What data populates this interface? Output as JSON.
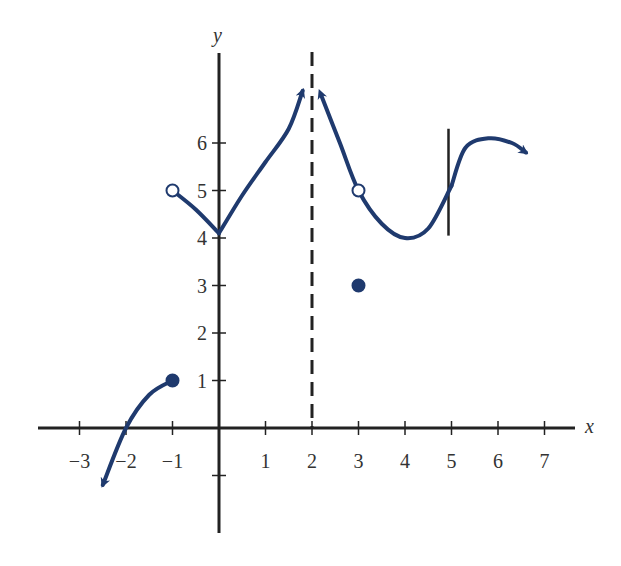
{
  "chart_data": {
    "type": "line",
    "title": "",
    "xlabel": "x",
    "ylabel": "y",
    "xlim": [
      -4,
      8
    ],
    "ylim": [
      -2,
      7
    ],
    "x_ticks": [
      -3,
      -2,
      -1,
      1,
      2,
      3,
      4,
      5,
      6,
      7
    ],
    "x_tick_labels": [
      "−3",
      "−2",
      "−1",
      "1",
      "2",
      "3",
      "4",
      "5",
      "6",
      "7"
    ],
    "y_ticks": [
      -1,
      1,
      2,
      3,
      4,
      5,
      6
    ],
    "y_tick_labels": [
      "",
      "1",
      "2",
      "3",
      "4",
      "5",
      "6"
    ],
    "grid": false,
    "curve_color": "#1f3a6e",
    "axis_color": "#222222",
    "asymptotes": [
      {
        "type": "vertical",
        "x": 2,
        "style": "dashed"
      }
    ],
    "tangent_lines": [
      {
        "type": "vertical",
        "x": 5,
        "y_range": [
          4.05,
          6.3
        ],
        "style": "solid"
      }
    ],
    "series": [
      {
        "name": "branch-left-lower",
        "points": [
          [
            -1,
            1
          ],
          [
            -1.5,
            0.7
          ],
          [
            -2,
            0
          ],
          [
            -2.5,
            -1.2
          ]
        ],
        "end_arrow": true
      },
      {
        "name": "branch-left-upper",
        "points": [
          [
            -1,
            5
          ],
          [
            -0.5,
            4.6
          ],
          [
            0,
            4.1
          ]
        ],
        "end_arrow": false
      },
      {
        "name": "branch-rising",
        "points": [
          [
            0,
            4.1
          ],
          [
            0.5,
            4.9
          ],
          [
            1,
            5.6
          ],
          [
            1.5,
            6.3
          ],
          [
            1.8,
            7.1
          ]
        ],
        "end_arrow": true
      },
      {
        "name": "branch-right-of-asymptote",
        "points": [
          [
            2.2,
            7.0
          ],
          [
            2.6,
            6.0
          ],
          [
            3,
            5
          ],
          [
            3.5,
            4.3
          ],
          [
            4,
            4.0
          ],
          [
            4.5,
            4.2
          ],
          [
            5,
            5.1
          ]
        ],
        "start_arrow": true
      },
      {
        "name": "branch-far-right",
        "points": [
          [
            5,
            5.1
          ],
          [
            5.3,
            5.9
          ],
          [
            5.8,
            6.1
          ],
          [
            6.3,
            6.0
          ],
          [
            6.6,
            5.8
          ]
        ],
        "end_arrow": true
      }
    ],
    "points": [
      {
        "x": -1,
        "y": 5,
        "filled": false
      },
      {
        "x": 3,
        "y": 5,
        "filled": false
      },
      {
        "x": -1,
        "y": 1,
        "filled": true
      },
      {
        "x": 3,
        "y": 3,
        "filled": true
      }
    ]
  }
}
